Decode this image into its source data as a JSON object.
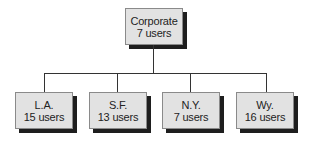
{
  "diagram": {
    "type": "org-chart",
    "root": {
      "name": "Corporate",
      "users": "7 users"
    },
    "children": [
      {
        "name": "L.A.",
        "users": "15 users"
      },
      {
        "name": "S.F.",
        "users": "13 users"
      },
      {
        "name": "N.Y.",
        "users": "7 users"
      },
      {
        "name": "Wy.",
        "users": "16 users"
      }
    ],
    "colors": {
      "box_fill": "#e2e2e2",
      "shadow": "#1e1e1e",
      "line": "#333333"
    }
  }
}
